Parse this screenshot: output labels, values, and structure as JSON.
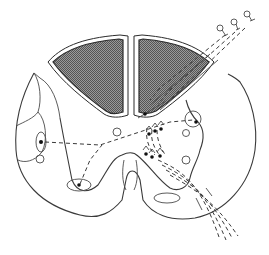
{
  "figure": {
    "type": "anatomical line drawing",
    "labels": [],
    "colors": {
      "background": "#ffffff",
      "line": "#3a3a3a",
      "dorsal_columns_fill": "#7a7a7a",
      "dot": "#111111"
    },
    "elements": {
      "dorsal_columns": {
        "count": 2,
        "pattern": "stippled/hatched gray"
      },
      "dorsal_root_fibers": {
        "count": 3,
        "style": "dashed",
        "terminal_icon": "ganglion cell (small circle with stalk)"
      },
      "ventral_root_fibers": {
        "count": 4,
        "style": "dashed"
      },
      "arrowheads": 6,
      "nuclei_circles": 6
    }
  }
}
